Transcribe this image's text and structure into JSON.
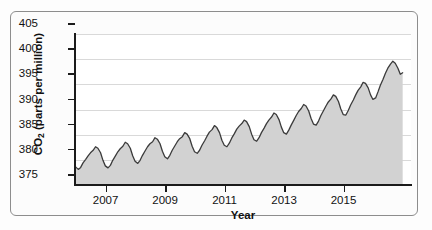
{
  "chart_data": {
    "type": "area",
    "title": "",
    "xlabel": "Year",
    "ylabel_prefix": "CO",
    "ylabel_sub": "2",
    "ylabel_suffix": " (parts per million)",
    "ylabel_plain": "CO2 (parts per million)",
    "xlim": [
      2005.6,
      2016.9
    ],
    "ylim": [
      375,
      405
    ],
    "grid": true,
    "legend": "none",
    "series_name": "Atmospheric CO2 concentration",
    "line_color": "#3b3b3b",
    "fill_color": "#d2d2d2",
    "background_color": "#ffffff",
    "x_ticks": [
      2007,
      2009,
      2011,
      2013,
      2015
    ],
    "x_tick_labels": [
      "2007",
      "2009",
      "2011",
      "2013",
      "2015"
    ],
    "y_ticks": [
      375,
      380,
      385,
      390,
      395,
      400,
      405
    ],
    "y_tick_labels": [
      "375",
      "380",
      "385",
      "390",
      "395",
      "400",
      "405"
    ],
    "x": [
      2005.62,
      2005.71,
      2005.79,
      2005.87,
      2005.96,
      2006.04,
      2006.12,
      2006.21,
      2006.29,
      2006.37,
      2006.46,
      2006.54,
      2006.62,
      2006.71,
      2006.79,
      2006.87,
      2006.96,
      2007.04,
      2007.12,
      2007.21,
      2007.29,
      2007.37,
      2007.46,
      2007.54,
      2007.62,
      2007.71,
      2007.79,
      2007.87,
      2007.96,
      2008.04,
      2008.12,
      2008.21,
      2008.29,
      2008.37,
      2008.46,
      2008.54,
      2008.62,
      2008.71,
      2008.79,
      2008.87,
      2008.96,
      2009.04,
      2009.12,
      2009.21,
      2009.29,
      2009.37,
      2009.46,
      2009.54,
      2009.62,
      2009.71,
      2009.79,
      2009.87,
      2009.96,
      2010.04,
      2010.12,
      2010.21,
      2010.29,
      2010.37,
      2010.46,
      2010.54,
      2010.62,
      2010.71,
      2010.79,
      2010.87,
      2010.96,
      2011.04,
      2011.12,
      2011.21,
      2011.29,
      2011.37,
      2011.46,
      2011.54,
      2011.62,
      2011.71,
      2011.79,
      2011.87,
      2011.96,
      2012.04,
      2012.12,
      2012.21,
      2012.29,
      2012.37,
      2012.46,
      2012.54,
      2012.62,
      2012.71,
      2012.79,
      2012.87,
      2012.96,
      2013.04,
      2013.12,
      2013.21,
      2013.29,
      2013.37,
      2013.46,
      2013.54,
      2013.62,
      2013.71,
      2013.79,
      2013.87,
      2013.96,
      2014.04,
      2014.12,
      2014.21,
      2014.29,
      2014.37,
      2014.46,
      2014.54,
      2014.62,
      2014.71,
      2014.79,
      2014.87,
      2014.96,
      2015.04,
      2015.12,
      2015.21,
      2015.29,
      2015.37,
      2015.46,
      2015.54,
      2015.62,
      2015.71,
      2015.79,
      2015.87,
      2015.96,
      2016.04,
      2016.12,
      2016.21,
      2016.29,
      2016.37,
      2016.46,
      2016.54,
      2016.62
    ],
    "y": [
      378.6,
      378.1,
      378.5,
      379.4,
      380.1,
      380.8,
      381.4,
      381.9,
      382.6,
      382.3,
      381.4,
      379.9,
      378.8,
      378.4,
      378.9,
      379.9,
      380.8,
      381.6,
      382.2,
      382.7,
      383.5,
      383.2,
      382.3,
      380.8,
      379.7,
      379.3,
      379.9,
      380.9,
      381.8,
      382.6,
      383.2,
      383.6,
      384.4,
      384.1,
      383.2,
      381.7,
      380.6,
      380.2,
      380.9,
      381.9,
      382.8,
      383.6,
      384.2,
      384.6,
      385.4,
      385.1,
      384.2,
      382.7,
      381.6,
      381.3,
      381.9,
      382.9,
      383.8,
      384.7,
      385.5,
      386.0,
      386.8,
      386.4,
      385.4,
      383.9,
      382.9,
      382.6,
      383.3,
      384.3,
      385.2,
      386.1,
      386.7,
      387.2,
      387.9,
      387.6,
      386.6,
      385.1,
      384.0,
      383.7,
      384.4,
      385.4,
      386.3,
      387.2,
      387.9,
      388.5,
      389.3,
      389.0,
      388.0,
      386.5,
      385.4,
      385.1,
      385.9,
      386.9,
      387.9,
      388.8,
      389.6,
      390.2,
      391.0,
      390.7,
      389.7,
      388.2,
      387.1,
      386.9,
      387.7,
      388.8,
      389.8,
      390.7,
      391.5,
      392.1,
      392.9,
      392.6,
      391.6,
      390.1,
      389.0,
      388.9,
      389.8,
      390.9,
      391.9,
      392.9,
      393.8,
      394.5,
      395.4,
      395.2,
      394.3,
      392.9,
      392.0,
      392.3,
      393.5,
      394.8,
      396.0,
      397.2,
      398.2,
      399.0,
      399.6,
      399.2,
      398.2,
      397.0,
      397.3
    ]
  }
}
